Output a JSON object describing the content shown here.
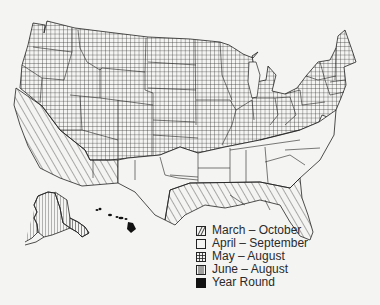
{
  "legend": {
    "items": [
      {
        "label": "March – October",
        "pattern": "diagonal"
      },
      {
        "label": "April – September",
        "pattern": "blank"
      },
      {
        "label": "May – August",
        "pattern": "crosshatch"
      },
      {
        "label": "June – August",
        "pattern": "vertical"
      },
      {
        "label": "Year Round",
        "pattern": "solid"
      }
    ]
  },
  "regions": [
    {
      "name": "Northern and central US",
      "season": "May – August"
    },
    {
      "name": "California and Southwest",
      "season": "March – October"
    },
    {
      "name": "Texas and southern-central states",
      "season": "April – September"
    },
    {
      "name": "Gulf Coast and Florida",
      "season": "March – October"
    },
    {
      "name": "Alaska",
      "season": "June – August"
    },
    {
      "name": "Hawaii",
      "season": "Year Round"
    }
  ],
  "colors": {
    "background": "#f4f4f2",
    "ink": "#2a2a2a"
  }
}
